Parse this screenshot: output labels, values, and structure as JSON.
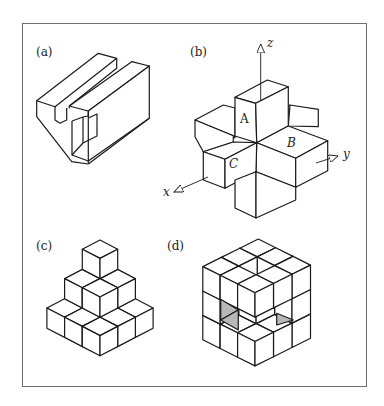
{
  "figure": {
    "panels": [
      {
        "id": "a",
        "label": "(a)",
        "label_pos": [
          36,
          46
        ],
        "description": "Isometric view of a slotted block with a chamfered corner and a rectangular cut-out"
      },
      {
        "id": "b",
        "label": "(b)",
        "label_pos": [
          190,
          46
        ],
        "description": "3D cross of boxes with x, y, z axes and faces A, B, C"
      },
      {
        "id": "c",
        "label": "(c)",
        "label_pos": [
          36,
          240
        ],
        "description": "Pyramid stack of six isometric cubes (3-2-1)"
      },
      {
        "id": "d",
        "label": "(d)",
        "label_pos": [
          168,
          240
        ],
        "description": "3x3x3 cube assembly with missing cubes and two shaded cavity floors"
      }
    ],
    "axes": {
      "x": {
        "label": "x",
        "pos": [
          164,
          186
        ]
      },
      "y": {
        "label": "y",
        "pos": [
          343,
          148
        ]
      },
      "z": {
        "label": "z",
        "pos": [
          268,
          37
        ]
      }
    },
    "face_labels": [
      {
        "text": "A",
        "pos": [
          240,
          113
        ],
        "italic": false
      },
      {
        "text": "B",
        "pos": [
          288,
          136
        ],
        "italic": true
      },
      {
        "text": "C",
        "pos": [
          229,
          157
        ],
        "italic": true
      }
    ]
  },
  "colors": {
    "line": "#1a1a1a",
    "frame": "#6e6e6e",
    "shade": "#b8b8b8",
    "background": "#ffffff"
  }
}
